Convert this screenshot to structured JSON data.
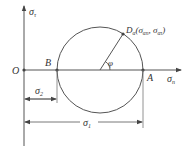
{
  "diagram": {
    "type": "mohr-circle",
    "colors": {
      "line": "#555555",
      "text": "#333333",
      "background": "#ffffff"
    },
    "axes": {
      "vertical_label": {
        "main": "σ",
        "sub": "τ"
      },
      "horizontal_label": {
        "main": "σ",
        "sub": "n"
      }
    },
    "points": {
      "origin": "O",
      "B": "B",
      "A": "A",
      "D": {
        "main": "D",
        "sub": "α",
        "coords_open": "(σ",
        "coord1_sub": "αn",
        "sep": ",  σ",
        "coord2_sub": "ατ",
        "coords_close": ")"
      }
    },
    "angle": "φ",
    "dimensions": {
      "sigma2": {
        "main": "σ",
        "sub": "2"
      },
      "sigma1": {
        "main": "σ",
        "sub": "1"
      }
    }
  }
}
